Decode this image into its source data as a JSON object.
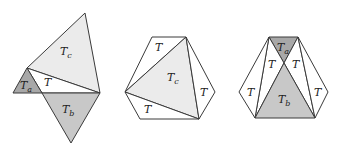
{
  "colors": {
    "light": "#ebebeb",
    "medium": "#c8c8c8",
    "dark": "#a8a8a8",
    "white": "#ffffff",
    "stroke": "#3a3a3a"
  },
  "figures": [
    {
      "id": "left",
      "triangles": [
        {
          "label": "T",
          "sub": "c",
          "fill": "light",
          "points": "85,13 27,68 100,93",
          "lx": 60,
          "ly": 55
        },
        {
          "label": "T",
          "sub": "",
          "fill": "white",
          "points": "27,68 42,93 100,93",
          "lx": 44,
          "ly": 86
        },
        {
          "label": "T",
          "sub": "a",
          "fill": "dark",
          "points": "27,68 13,93 42,93",
          "lx": 20,
          "ly": 89
        },
        {
          "label": "T",
          "sub": "b",
          "fill": "medium",
          "points": "42,93 100,93 71,143",
          "lx": 62,
          "ly": 113
        }
      ]
    },
    {
      "id": "middle",
      "triangles": [
        {
          "label": "T",
          "sub": "",
          "fill": "white",
          "points": "152,37 186,37 125,92",
          "lx": 155,
          "ly": 51
        },
        {
          "label": "T",
          "sub": "c",
          "fill": "light",
          "points": "186,37 125,92 199,119",
          "lx": 167,
          "ly": 81
        },
        {
          "label": "T",
          "sub": "",
          "fill": "white",
          "points": "186,37 215,92 199,119",
          "lx": 200,
          "ly": 96
        },
        {
          "label": "T",
          "sub": "",
          "fill": "white",
          "points": "125,92 140,119 199,119",
          "lx": 144,
          "ly": 113
        }
      ]
    },
    {
      "id": "right",
      "triangles": [
        {
          "label": "T",
          "sub": "a",
          "fill": "dark",
          "points": "269,37 298,37 284,63",
          "lx": 277,
          "ly": 51
        },
        {
          "label": "T",
          "sub": "",
          "fill": "white",
          "points": "269,37 284,63 255,118",
          "lx": 268,
          "ly": 68
        },
        {
          "label": "T",
          "sub": "",
          "fill": "white",
          "points": "298,37 284,63 315,118",
          "lx": 292,
          "ly": 68
        },
        {
          "label": "T",
          "sub": "b",
          "fill": "medium",
          "points": "284,63 255,118 315,118",
          "lx": 278,
          "ly": 103
        },
        {
          "label": "T",
          "sub": "",
          "fill": "white",
          "points": "269,37 239,92 255,118",
          "lx": 247,
          "ly": 96
        },
        {
          "label": "T",
          "sub": "",
          "fill": "white",
          "points": "298,37 328,92 315,118",
          "lx": 314,
          "ly": 96
        }
      ]
    }
  ]
}
